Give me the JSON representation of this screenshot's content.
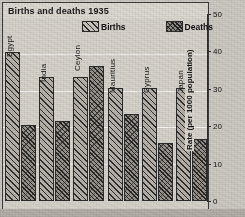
{
  "title": "Births and deaths 1935",
  "legend": {
    "births_label": "Births",
    "deaths_label": "Deaths"
  },
  "axis": {
    "title": "Rate (per 1000 population)",
    "ticks": [
      "50",
      "40",
      "30",
      "20",
      "10",
      "0"
    ]
  },
  "chart_data": {
    "type": "bar",
    "title": "Births and deaths 1935",
    "xlabel": "",
    "ylabel": "Rate (per 1000 population)",
    "ylim": [
      0,
      50
    ],
    "yticks": [
      0,
      10,
      20,
      30,
      40,
      50
    ],
    "grid": true,
    "legend_position": "top-center",
    "categories": [
      "Egypt",
      "India",
      "Ceylon",
      "Mauritius",
      "Cyprus",
      "Japan"
    ],
    "series": [
      {
        "name": "Births",
        "values": [
          41,
          34,
          34,
          31,
          31,
          31
        ]
      },
      {
        "name": "Deaths",
        "values": [
          21,
          22,
          37,
          24,
          16,
          17
        ]
      }
    ]
  }
}
